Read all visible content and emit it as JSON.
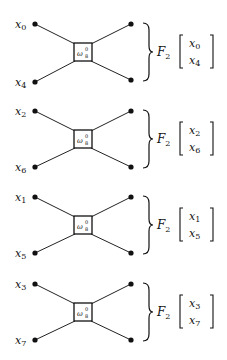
{
  "diagram": {
    "node_label": {
      "base": "ω",
      "sup": "0",
      "sub": "8"
    },
    "operator": {
      "base": "F",
      "sub": "2"
    },
    "blocks": [
      {
        "top_input": {
          "base": "x",
          "sub": "0"
        },
        "bottom_input": {
          "base": "x",
          "sub": "4"
        },
        "vector": [
          {
            "base": "x",
            "sub": "0"
          },
          {
            "base": "x",
            "sub": "4"
          }
        ]
      },
      {
        "top_input": {
          "base": "x",
          "sub": "2"
        },
        "bottom_input": {
          "base": "x",
          "sub": "6"
        },
        "vector": [
          {
            "base": "x",
            "sub": "2"
          },
          {
            "base": "x",
            "sub": "6"
          }
        ]
      },
      {
        "top_input": {
          "base": "x",
          "sub": "1"
        },
        "bottom_input": {
          "base": "x",
          "sub": "5"
        },
        "vector": [
          {
            "base": "x",
            "sub": "1"
          },
          {
            "base": "x",
            "sub": "5"
          }
        ]
      },
      {
        "top_input": {
          "base": "x",
          "sub": "3"
        },
        "bottom_input": {
          "base": "x",
          "sub": "7"
        },
        "vector": [
          {
            "base": "x",
            "sub": "3"
          },
          {
            "base": "x",
            "sub": "7"
          }
        ]
      }
    ]
  }
}
